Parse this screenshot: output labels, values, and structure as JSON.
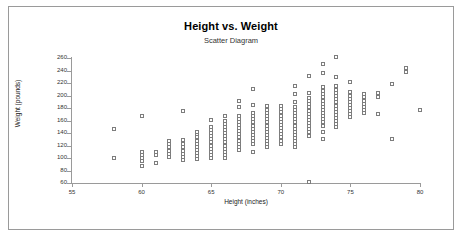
{
  "chart_data": {
    "type": "scatter",
    "title": "Height vs. Weight",
    "subtitle": "Scatter Diagram",
    "xlabel": "Height (inches)",
    "ylabel": "Weight (pounds)",
    "xlim": [
      55,
      80
    ],
    "ylim": [
      60,
      260
    ],
    "xticks": [
      55,
      60,
      65,
      70,
      75,
      80
    ],
    "yticks": [
      60,
      80,
      100,
      120,
      140,
      160,
      180,
      200,
      220,
      240,
      260
    ],
    "grid": false,
    "legend": false,
    "marker": "open-square",
    "marker_color": "#7d7d7d",
    "axis_color": "#9a9a9a",
    "series": [
      {
        "name": "Height vs Weight",
        "points": [
          [
            58,
            100
          ],
          [
            58,
            147
          ],
          [
            60,
            87
          ],
          [
            60,
            95
          ],
          [
            60,
            100
          ],
          [
            60,
            105
          ],
          [
            60,
            110
          ],
          [
            60,
            168
          ],
          [
            61,
            92
          ],
          [
            61,
            105
          ],
          [
            61,
            110
          ],
          [
            62,
            102
          ],
          [
            62,
            107
          ],
          [
            62,
            112
          ],
          [
            62,
            117
          ],
          [
            62,
            122
          ],
          [
            62,
            128
          ],
          [
            63,
            97
          ],
          [
            63,
            102
          ],
          [
            63,
            107
          ],
          [
            63,
            112
          ],
          [
            63,
            117
          ],
          [
            63,
            122
          ],
          [
            63,
            129
          ],
          [
            63,
            176
          ],
          [
            64,
            98
          ],
          [
            64,
            103
          ],
          [
            64,
            108
          ],
          [
            64,
            113
          ],
          [
            64,
            118
          ],
          [
            64,
            123
          ],
          [
            64,
            128
          ],
          [
            64,
            133
          ],
          [
            64,
            138
          ],
          [
            64,
            142
          ],
          [
            65,
            100
          ],
          [
            65,
            105
          ],
          [
            65,
            110
          ],
          [
            65,
            115
          ],
          [
            65,
            120
          ],
          [
            65,
            125
          ],
          [
            65,
            130
          ],
          [
            65,
            135
          ],
          [
            65,
            140
          ],
          [
            65,
            145
          ],
          [
            65,
            150
          ],
          [
            65,
            161
          ],
          [
            66,
            100
          ],
          [
            66,
            105
          ],
          [
            66,
            110
          ],
          [
            66,
            115
          ],
          [
            66,
            120
          ],
          [
            66,
            125
          ],
          [
            66,
            130
          ],
          [
            66,
            135
          ],
          [
            66,
            140
          ],
          [
            66,
            145
          ],
          [
            66,
            150
          ],
          [
            66,
            155
          ],
          [
            66,
            160
          ],
          [
            66,
            168
          ],
          [
            67,
            113
          ],
          [
            67,
            118
          ],
          [
            67,
            123
          ],
          [
            67,
            128
          ],
          [
            67,
            133
          ],
          [
            67,
            138
          ],
          [
            67,
            143
          ],
          [
            67,
            148
          ],
          [
            67,
            153
          ],
          [
            67,
            158
          ],
          [
            67,
            163
          ],
          [
            67,
            168
          ],
          [
            67,
            181
          ],
          [
            67,
            192
          ],
          [
            68,
            110
          ],
          [
            68,
            122
          ],
          [
            68,
            127
          ],
          [
            68,
            132
          ],
          [
            68,
            137
          ],
          [
            68,
            142
          ],
          [
            68,
            147
          ],
          [
            68,
            152
          ],
          [
            68,
            157
          ],
          [
            68,
            162
          ],
          [
            68,
            167
          ],
          [
            68,
            172
          ],
          [
            68,
            185
          ],
          [
            68,
            211
          ],
          [
            69,
            117
          ],
          [
            69,
            122
          ],
          [
            69,
            127
          ],
          [
            69,
            132
          ],
          [
            69,
            137
          ],
          [
            69,
            142
          ],
          [
            69,
            147
          ],
          [
            69,
            152
          ],
          [
            69,
            157
          ],
          [
            69,
            162
          ],
          [
            69,
            167
          ],
          [
            69,
            172
          ],
          [
            69,
            177
          ],
          [
            69,
            183
          ],
          [
            70,
            123
          ],
          [
            70,
            128
          ],
          [
            70,
            133
          ],
          [
            70,
            138
          ],
          [
            70,
            143
          ],
          [
            70,
            148
          ],
          [
            70,
            153
          ],
          [
            70,
            158
          ],
          [
            70,
            163
          ],
          [
            70,
            168
          ],
          [
            70,
            173
          ],
          [
            70,
            178
          ],
          [
            70,
            183
          ],
          [
            71,
            117
          ],
          [
            71,
            122
          ],
          [
            71,
            127
          ],
          [
            71,
            132
          ],
          [
            71,
            137
          ],
          [
            71,
            142
          ],
          [
            71,
            147
          ],
          [
            71,
            152
          ],
          [
            71,
            157
          ],
          [
            71,
            162
          ],
          [
            71,
            167
          ],
          [
            71,
            172
          ],
          [
            71,
            177
          ],
          [
            71,
            182
          ],
          [
            71,
            190
          ],
          [
            71,
            202
          ],
          [
            71,
            216
          ],
          [
            72,
            61
          ],
          [
            72,
            136
          ],
          [
            72,
            141
          ],
          [
            72,
            146
          ],
          [
            72,
            151
          ],
          [
            72,
            156
          ],
          [
            72,
            161
          ],
          [
            72,
            166
          ],
          [
            72,
            171
          ],
          [
            72,
            176
          ],
          [
            72,
            181
          ],
          [
            72,
            186
          ],
          [
            72,
            191
          ],
          [
            72,
            196
          ],
          [
            72,
            204
          ],
          [
            72,
            231
          ],
          [
            73,
            131
          ],
          [
            73,
            142
          ],
          [
            73,
            152
          ],
          [
            73,
            157
          ],
          [
            73,
            162
          ],
          [
            73,
            167
          ],
          [
            73,
            172
          ],
          [
            73,
            177
          ],
          [
            73,
            182
          ],
          [
            73,
            187
          ],
          [
            73,
            192
          ],
          [
            73,
            197
          ],
          [
            73,
            202
          ],
          [
            73,
            207
          ],
          [
            73,
            214
          ],
          [
            73,
            236
          ],
          [
            73,
            251
          ],
          [
            74,
            149
          ],
          [
            74,
            154
          ],
          [
            74,
            159
          ],
          [
            74,
            164
          ],
          [
            74,
            169
          ],
          [
            74,
            174
          ],
          [
            74,
            179
          ],
          [
            74,
            184
          ],
          [
            74,
            189
          ],
          [
            74,
            194
          ],
          [
            74,
            199
          ],
          [
            74,
            204
          ],
          [
            74,
            209
          ],
          [
            74,
            215
          ],
          [
            74,
            230
          ],
          [
            74,
            261
          ],
          [
            75,
            165
          ],
          [
            75,
            170
          ],
          [
            75,
            175
          ],
          [
            75,
            180
          ],
          [
            75,
            185
          ],
          [
            75,
            190
          ],
          [
            75,
            195
          ],
          [
            75,
            200
          ],
          [
            75,
            206
          ],
          [
            75,
            221
          ],
          [
            76,
            172
          ],
          [
            76,
            177
          ],
          [
            76,
            182
          ],
          [
            76,
            187
          ],
          [
            76,
            192
          ],
          [
            76,
            197
          ],
          [
            76,
            203
          ],
          [
            77,
            171
          ],
          [
            77,
            198
          ],
          [
            77,
            204
          ],
          [
            78,
            130
          ],
          [
            78,
            219
          ],
          [
            79,
            238
          ],
          [
            79,
            244
          ],
          [
            80,
            177
          ]
        ]
      }
    ]
  }
}
